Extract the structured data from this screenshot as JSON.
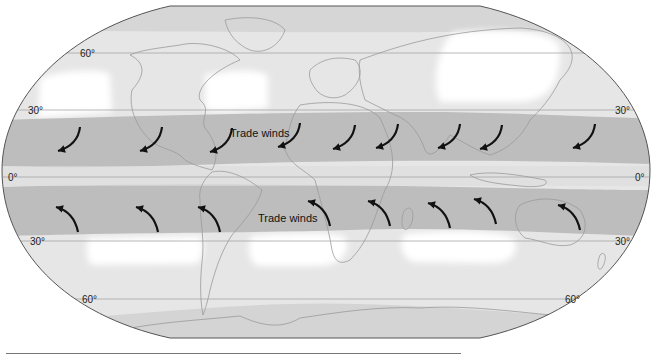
{
  "colors": {
    "zone_white": "#ffffff",
    "zone_light": "#e6e6e6",
    "zone_mid": "#d6d6d6",
    "zone_trade": "#bdbdbd",
    "coast": "#9a9a9a",
    "arrow": "#111111",
    "outline": "#555555",
    "gridline": "#9c9c9c"
  },
  "latitude_labels": [
    {
      "lat": 60,
      "text": "60°",
      "side": "left"
    },
    {
      "lat": 30,
      "text": "30°",
      "side": "left"
    },
    {
      "lat": 30,
      "text": "30°",
      "side": "right"
    },
    {
      "lat": 0,
      "text": "0°",
      "side": "left"
    },
    {
      "lat": 0,
      "text": "0°",
      "side": "right"
    },
    {
      "lat": -30,
      "text": "30°",
      "side": "left"
    },
    {
      "lat": -30,
      "text": "30°",
      "side": "right"
    },
    {
      "lat": -60,
      "text": "60°",
      "side": "left"
    },
    {
      "lat": -60,
      "text": "60°",
      "side": "right"
    }
  ],
  "wind_labels": [
    {
      "text": "Trade winds",
      "hemisphere": "north"
    },
    {
      "text": "Trade winds",
      "hemisphere": "south"
    }
  ],
  "arrows": {
    "north": {
      "direction": "southwest",
      "count": 11
    },
    "south": {
      "direction": "northwest",
      "count": 10
    }
  }
}
